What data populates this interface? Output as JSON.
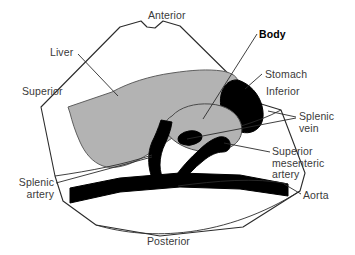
{
  "figure": {
    "type": "anatomical-cross-section",
    "colors": {
      "organ_gray": "#b3b3b3",
      "vessel_black": "#000000",
      "outline": "#1a1a1a",
      "text": "#3a3a3a",
      "background": "#ffffff"
    }
  },
  "orientation_labels": [
    {
      "key": "anterior",
      "text": "Anterior",
      "x": 148,
      "y": 10
    },
    {
      "key": "superior",
      "text": "Superior",
      "x": 22,
      "y": 86
    },
    {
      "key": "inferior",
      "text": "Inferior",
      "x": 266,
      "y": 86
    },
    {
      "key": "posterior",
      "text": "Posterior",
      "x": 147,
      "y": 236
    }
  ],
  "structure_labels": [
    {
      "key": "liver",
      "text": "Liver",
      "bold": false,
      "align": "left",
      "x": 50,
      "y": 47
    },
    {
      "key": "body",
      "text": "Body",
      "bold": true,
      "align": "left",
      "x": 259,
      "y": 29
    },
    {
      "key": "stomach",
      "text": "Stomach",
      "bold": false,
      "align": "left",
      "x": 265,
      "y": 69
    },
    {
      "key": "splenic_vein",
      "text": "Splenic\nvein",
      "bold": false,
      "align": "left",
      "x": 299,
      "y": 111
    },
    {
      "key": "superior_mesenteric_artery",
      "text": "Superior\nmesenteric\nartery",
      "bold": false,
      "align": "left",
      "x": 272,
      "y": 146
    },
    {
      "key": "aorta",
      "text": "Aorta",
      "bold": false,
      "align": "left",
      "x": 303,
      "y": 190
    },
    {
      "key": "splenic_artery",
      "text": "Splenic\nartery",
      "bold": false,
      "align": "right",
      "x": 14,
      "y": 177
    }
  ],
  "leader_lines": [
    {
      "key": "liver-leader",
      "from": [
        78,
        54
      ],
      "to": [
        115,
        93
      ]
    },
    {
      "key": "body-leader",
      "from": [
        257,
        33
      ],
      "to": [
        204,
        118
      ]
    },
    {
      "key": "stomach-leader",
      "from": [
        263,
        73
      ],
      "to": [
        246,
        90
      ]
    },
    {
      "key": "splenic-vein-leader",
      "from": [
        297,
        117
      ],
      "to": [
        270,
        112
      ]
    },
    {
      "key": "splenic-vein-leader-2",
      "from": [
        297,
        117
      ],
      "to": [
        186,
        138
      ]
    },
    {
      "key": "sma-leader",
      "from": [
        270,
        152
      ],
      "to": [
        222,
        143
      ]
    },
    {
      "key": "aorta-leader",
      "from": [
        301,
        194
      ],
      "to": [
        285,
        185
      ]
    },
    {
      "key": "splenic-artery-leader",
      "from": [
        56,
        182
      ],
      "to": [
        150,
        158
      ]
    }
  ]
}
